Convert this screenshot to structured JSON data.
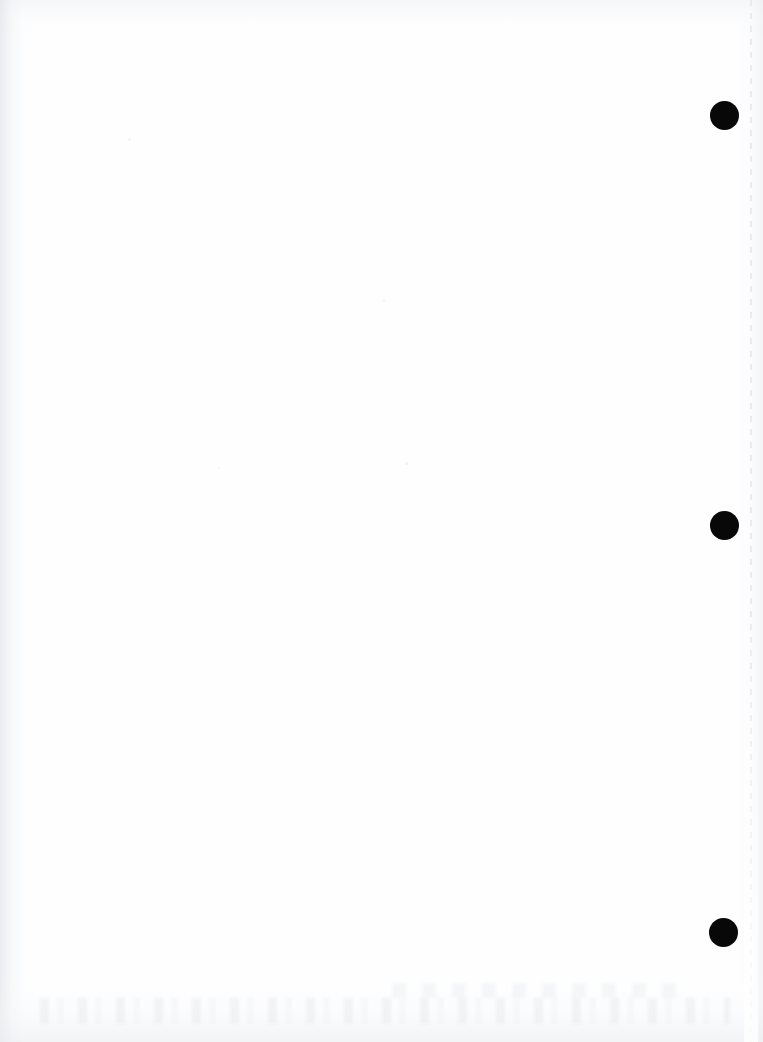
{
  "page": {
    "kind": "scanned-blank-page",
    "width": 763,
    "height": 1042,
    "background_color": "#fefeff",
    "body_text": "",
    "caption": ""
  },
  "marks": {
    "label": "binding-marks",
    "color": "#080808",
    "diameter": 29,
    "items": [
      {
        "name": "mark-top",
        "x": 710,
        "y": 101
      },
      {
        "name": "mark-middle",
        "x": 710,
        "y": 511
      },
      {
        "name": "mark-bottom",
        "x": 709,
        "y": 918
      }
    ]
  },
  "guide": {
    "name": "right-margin-dashed-line",
    "color": "#e9eaee",
    "x": 750
  },
  "specks": [
    {
      "x": 128,
      "y": 138,
      "size": 3
    },
    {
      "x": 405,
      "y": 462,
      "size": 3
    },
    {
      "x": 383,
      "y": 300,
      "size": 2
    },
    {
      "x": 218,
      "y": 467,
      "size": 2
    },
    {
      "x": 908,
      "y": 990,
      "size": 2
    }
  ]
}
